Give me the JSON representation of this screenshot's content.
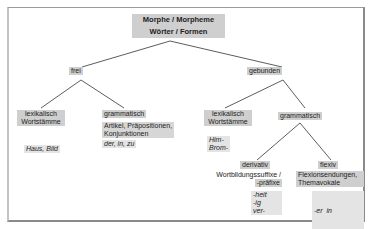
{
  "diagram": {
    "root": {
      "line1": "Morphe / Morpheme",
      "line2": "Wörter / Formen"
    },
    "level1": {
      "left": "frei",
      "right": "gebunden"
    },
    "frei": {
      "lexikalisch": {
        "label_line1": "lexikalisch",
        "label_line2": "Wortstämme",
        "example": "Haus, Bild"
      },
      "grammatisch": {
        "label": "grammatisch",
        "desc_line1": "Artikel, Präpositionen,",
        "desc_line2": "Konjunktionen",
        "example": "der, in, zu"
      }
    },
    "gebunden": {
      "lexikalisch": {
        "label_line1": "lexikalisch",
        "label_line2": "Wortstämme",
        "example_line1": "Him-",
        "example_line2": "Brom-"
      },
      "grammatisch": {
        "label": "grammatisch",
        "derivativ": {
          "label": "derivativ",
          "desc_line1": "Wortbildungssuffixe /",
          "desc_line2": "-präfixe",
          "example_line1": "-heit",
          "example_line2": "-ig",
          "example_line3": "ver-"
        },
        "flexiv": {
          "label": "flexiv",
          "desc_line1": "Flexionsendungen,",
          "desc_line2": "Themavokale",
          "example_line1": "-er  in",
          "example_line2": "Kind-er",
          "example_line3": "-t  in  geh-t"
        }
      }
    },
    "colors": {
      "box_fill": "#cfcfcf",
      "box_fill_light": "#e4e4e4",
      "line": "#333333",
      "frame": "#8a8a8a"
    }
  }
}
